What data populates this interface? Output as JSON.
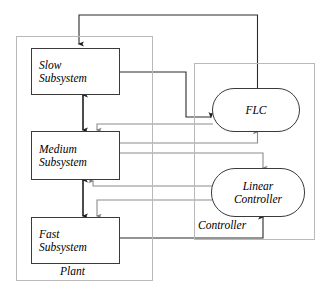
{
  "diagram": {
    "containers": [
      {
        "id": "plant",
        "label": "Plant"
      },
      {
        "id": "controller",
        "label": "Controller"
      }
    ],
    "plant_blocks": [
      {
        "id": "slow",
        "line1": "Slow",
        "line2": "Subsystem"
      },
      {
        "id": "medium",
        "line1": "Medium",
        "line2": "Subsystem"
      },
      {
        "id": "fast",
        "line1": "Fast",
        "line2": "Subsystem"
      }
    ],
    "controller_blocks": [
      {
        "id": "flc",
        "line1": "FLC",
        "line2": ""
      },
      {
        "id": "linear",
        "line1": "Linear",
        "line2": "Controller"
      }
    ],
    "colors": {
      "node_stroke": "#3a3a3a",
      "container_stroke": "#b9b9b9",
      "signal_dark": "#2b2b2b",
      "signal_grey": "#8c8c8c",
      "background": "#ffffff"
    },
    "connections": [
      {
        "from": "flc",
        "to": "slow",
        "style": "dark",
        "note": "top feedback loop"
      },
      {
        "from": "slow",
        "to": "flc",
        "style": "dark",
        "note": "slow state to FLC input"
      },
      {
        "from": "slow",
        "to": "medium",
        "style": "dark",
        "note": "bidirectional coupling"
      },
      {
        "from": "medium",
        "to": "fast",
        "style": "dark",
        "note": "bidirectional coupling"
      },
      {
        "from": "flc",
        "to": "medium",
        "style": "grey",
        "note": "FLC command to medium"
      },
      {
        "from": "medium",
        "to": "flc",
        "style": "grey",
        "note": "medium state to FLC"
      },
      {
        "from": "medium",
        "to": "linear",
        "style": "grey",
        "note": "medium state to linear controller"
      },
      {
        "from": "linear",
        "to": "medium",
        "style": "grey",
        "note": "linear command to medium"
      },
      {
        "from": "linear",
        "to": "fast",
        "style": "grey",
        "note": "linear command to fast"
      },
      {
        "from": "fast",
        "to": "linear",
        "style": "dark",
        "note": "fast state to linear controller"
      }
    ]
  }
}
